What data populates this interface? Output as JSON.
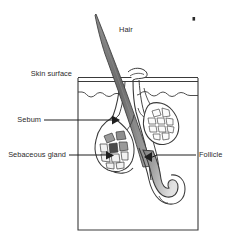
{
  "figure": {
    "background_color": "#ffffff",
    "line_color": "#3a3a3a",
    "text_color": "#2b2b2b"
  },
  "labels": {
    "hair": "Hair",
    "skin_surface": "Skin surface",
    "sebum": "Sebum",
    "sebaceous_gland": "Sebaceous gland",
    "follicle": "Follicle"
  },
  "structures": {
    "skin_box": "skin-block-outline",
    "epidermis_line": "wavy-epidermis-boundary",
    "hair_shaft": "hair-shaft",
    "follicle_canal": "follicle-canal",
    "hair_bulb": "hair-bulb",
    "sebaceous_gland_left": "sebaceous-gland-left",
    "sebaceous_gland_right": "sebaceous-gland-right",
    "pore_opening": "pore-opening-flap",
    "speck": "stray-ink-speck"
  },
  "colors": {
    "outline": "#3a3a3a",
    "hair_fill_dark": "#6e6e6e",
    "hair_fill_light": "#b9b9b9",
    "bulb_fill_dark": "#7d7d7d",
    "bulb_fill_light": "#dcdcdc",
    "gland_cell_grey": "#9a9a9a",
    "gland_cell_dark": "#4a4a4a",
    "gland_cell_light": "#f2f2f2",
    "arrow_fill": "#1e1e1e"
  }
}
